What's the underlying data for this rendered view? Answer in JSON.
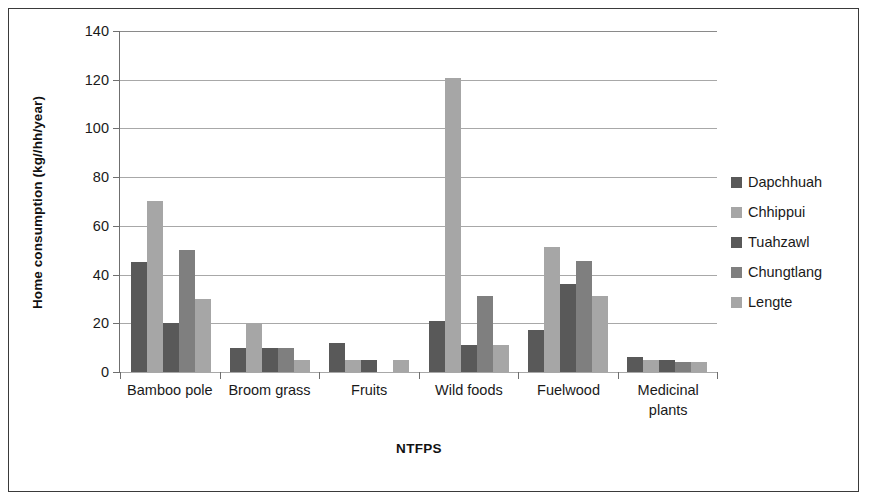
{
  "chart_data": {
    "type": "bar",
    "title": "",
    "subtitle": "",
    "xlabel": "NTFPS",
    "ylabel": "Home consumption (kg//hh/year)",
    "categories": [
      "Bamboo pole",
      "Broom grass",
      "Fruits",
      "Wild foods",
      "Fuelwood",
      "Medicinal plants"
    ],
    "series": [
      {
        "name": "Dapchhuah",
        "color": "#595959",
        "values": [
          45,
          10,
          12,
          21,
          17,
          6
        ]
      },
      {
        "name": "Chhippui",
        "color": "#a6a6a6",
        "values": [
          70,
          20,
          5,
          120.5,
          51,
          5
        ]
      },
      {
        "name": "Tuahzawl",
        "color": "#595959",
        "values": [
          20,
          10,
          5,
          11,
          36,
          5
        ]
      },
      {
        "name": "Chungtlang",
        "color": "#7f7f7f",
        "values": [
          50,
          10,
          0,
          31,
          45.5,
          4
        ]
      },
      {
        "name": "Lengte",
        "color": "#a6a6a6",
        "values": [
          30,
          5,
          5,
          11,
          31,
          4
        ]
      }
    ],
    "ylim": [
      0,
      140
    ],
    "yticks": [
      0,
      20,
      40,
      60,
      80,
      100,
      120,
      140
    ],
    "ytick_labels": [
      "0",
      "20",
      "40",
      "60",
      "80",
      "100",
      "120",
      "140"
    ],
    "grid": true,
    "grid_axis": "y",
    "legend_position": "right",
    "bar_gap": "grouped"
  },
  "axis": {
    "y_title": "Home consumption (kg//hh/year)",
    "x_title": "NTFPS"
  },
  "legend": {
    "items": [
      {
        "label": "Dapchhuah",
        "color": "#595959"
      },
      {
        "label": "Chhippui",
        "color": "#a6a6a6"
      },
      {
        "label": "Tuahzawl",
        "color": "#595959"
      },
      {
        "label": "Chungtlang",
        "color": "#7f7f7f"
      },
      {
        "label": "Lengte",
        "color": "#a6a6a6"
      }
    ]
  }
}
